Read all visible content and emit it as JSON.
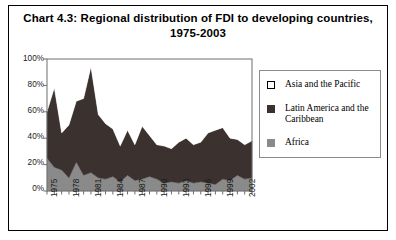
{
  "figure": {
    "title": "Chart 4.3:  Regional distribution of FDI to developing countries, 1975-2003"
  },
  "legend": {
    "items": [
      {
        "label": "Asia and the Pacific",
        "color": "#ffffff",
        "border": "#000000"
      },
      {
        "label": "Latin America and the Caribbean",
        "color": "#3b3230",
        "border": "#3b3230"
      },
      {
        "label": "Africa",
        "color": "#8a8a8a",
        "border": "#8a8a8a"
      }
    ]
  },
  "chart_data": {
    "type": "area",
    "stacked": true,
    "normalized": true,
    "title": "Chart 4.3:  Regional distribution of FDI to developing countries, 1975-2003",
    "xlabel": "",
    "ylabel": "",
    "ylim": [
      0,
      100
    ],
    "yticks": [
      0,
      20,
      40,
      60,
      80,
      100
    ],
    "ytick_labels": [
      "0%",
      "20%",
      "40%",
      "60%",
      "80%",
      "100%"
    ],
    "grid": false,
    "legend_position": "right",
    "x": [
      1975,
      1976,
      1977,
      1978,
      1979,
      1980,
      1981,
      1982,
      1983,
      1984,
      1985,
      1986,
      1987,
      1988,
      1989,
      1990,
      1991,
      1992,
      1993,
      1994,
      1995,
      1996,
      1997,
      1998,
      1999,
      2000,
      2001,
      2002,
      2003
    ],
    "xtick_labels": [
      "1975",
      "1978",
      "1981",
      "1984",
      "1987",
      "1990",
      "1993",
      "1996",
      "1999",
      "2002"
    ],
    "xtick_values": [
      1975,
      1978,
      1981,
      1984,
      1987,
      1990,
      1993,
      1996,
      1999,
      2002
    ],
    "series": [
      {
        "name": "Africa",
        "color": "#8a8a8a",
        "values": [
          25,
          18,
          16,
          10,
          22,
          12,
          14,
          10,
          9,
          11,
          7,
          12,
          8,
          9,
          11,
          9,
          6,
          7,
          6,
          8,
          6,
          7,
          6,
          5,
          9,
          8,
          12,
          9,
          10
        ]
      },
      {
        "name": "Latin America and the Caribbean",
        "color": "#3b3230",
        "values": [
          35,
          60,
          28,
          40,
          46,
          58,
          80,
          48,
          42,
          36,
          27,
          34,
          27,
          40,
          31,
          26,
          28,
          25,
          31,
          32,
          29,
          30,
          38,
          41,
          39,
          32,
          27,
          26,
          28
        ]
      },
      {
        "name": "Asia and the Pacific",
        "color": "#ffffff",
        "values": [
          40,
          22,
          56,
          50,
          32,
          30,
          6,
          42,
          49,
          53,
          66,
          54,
          65,
          51,
          58,
          65,
          66,
          68,
          63,
          60,
          65,
          63,
          56,
          54,
          52,
          60,
          61,
          65,
          62
        ]
      }
    ],
    "totals_excl_asia": [
      60,
      78,
      44,
      50,
      68,
      70,
      94,
      58,
      51,
      47,
      34,
      46,
      35,
      49,
      42,
      35,
      34,
      32,
      37,
      40,
      35,
      37,
      44,
      46,
      48,
      40,
      39,
      35,
      38
    ]
  }
}
